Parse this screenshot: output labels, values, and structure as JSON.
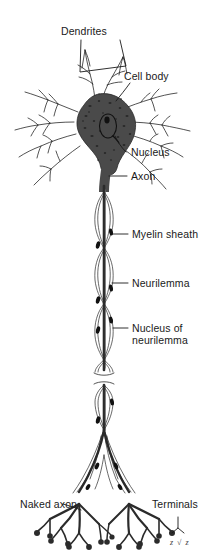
{
  "figure": {
    "background_color": "#ffffff",
    "ink_color": "#1a1a1a",
    "soma_fill": "#4a4a4a",
    "width": 208,
    "height": 555
  },
  "labels": {
    "dendrites": "Dendrites",
    "cell_body": "Cell body",
    "nucleus": "Nucleus",
    "axon": "Axon",
    "myelin_sheath": "Myelin sheath",
    "neurilemma": "Neurilemma",
    "nucleus_of_neurilemma_line1": "Nucleus of",
    "nucleus_of_neurilemma_line2": "neurilemma",
    "naked_axon": "Naked axon",
    "terminals": "Terminals"
  },
  "signature": "z √ z"
}
